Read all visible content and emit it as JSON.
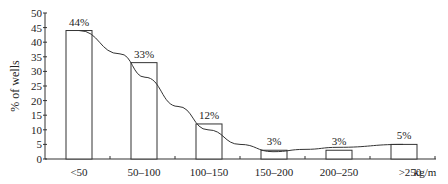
{
  "chart_data": {
    "type": "bar",
    "title": "",
    "xlabel": "kg/m",
    "ylabel": "% of wells",
    "ylim": [
      0,
      50
    ],
    "yticks": [
      0,
      5,
      10,
      15,
      20,
      25,
      30,
      35,
      40,
      45,
      50
    ],
    "categories": [
      "<50",
      "50–100",
      "100–150",
      "150–200",
      "200–250",
      ">250"
    ],
    "values": [
      44,
      33,
      12,
      3,
      3,
      5
    ],
    "data_labels": [
      "44%",
      "33%",
      "12%",
      "3%",
      "3%",
      "5%"
    ],
    "x_unit_label": "kg/m",
    "overlay": {
      "type": "line",
      "description": "smoothed trend curve",
      "values": [
        44,
        33,
        12,
        3,
        3,
        5
      ]
    },
    "grid": false,
    "legend": null
  }
}
